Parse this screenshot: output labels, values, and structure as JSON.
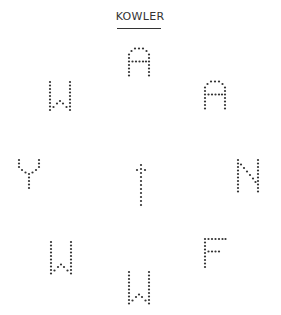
{
  "title": "KOWLER",
  "colors": {
    "dot": "#333333",
    "text": "#333333",
    "background": "#ffffff"
  },
  "letters": [
    {
      "char": "A",
      "position": "top",
      "x": 127,
      "y": 47
    },
    {
      "char": "W",
      "position": "upper-left",
      "x": 48,
      "y": 80
    },
    {
      "char": "A",
      "position": "upper-right",
      "x": 203,
      "y": 80
    },
    {
      "char": "Y",
      "position": "left",
      "x": 17,
      "y": 158
    },
    {
      "char": "†",
      "position": "center",
      "x": 135,
      "y": 163
    },
    {
      "char": "N",
      "position": "right",
      "x": 236,
      "y": 158
    },
    {
      "char": "W",
      "position": "lower-left",
      "x": 49,
      "y": 240
    },
    {
      "char": "F",
      "position": "lower-right",
      "x": 203,
      "y": 237
    },
    {
      "char": "W",
      "position": "bottom",
      "x": 127,
      "y": 270
    }
  ]
}
